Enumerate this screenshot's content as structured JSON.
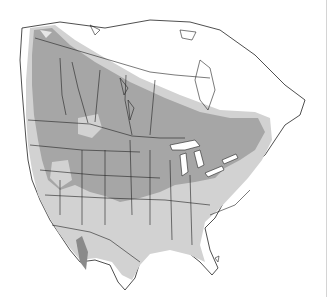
{
  "map": {
    "title": "North America range map",
    "region": "North America",
    "legend": [
      {
        "name": "primary-range",
        "color": "#a6a6a6"
      },
      {
        "name": "secondary-range",
        "color": "#d2d2d2"
      },
      {
        "name": "peak-area",
        "color": "#8a8a8a"
      },
      {
        "name": "outside-range",
        "color": "#ffffff"
      }
    ],
    "colors": {
      "background": "#ffffff",
      "land": "#ffffff",
      "primary_fill": "#a6a6a6",
      "secondary_fill": "#d2d2d2",
      "dark_fill": "#8a8a8a",
      "boundary": "#222222",
      "edge_line": "#d4d4d4"
    }
  }
}
